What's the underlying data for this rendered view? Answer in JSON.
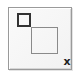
{
  "icon": {
    "semantic": "window-close-restore-icon",
    "close_glyph": "x",
    "colors": {
      "frame_border": "#9a9a9a",
      "frame_fill": "#f5f5f5",
      "small_square": "#333333",
      "large_square": "#8a8a8a",
      "close_glyph": "#222222"
    }
  }
}
